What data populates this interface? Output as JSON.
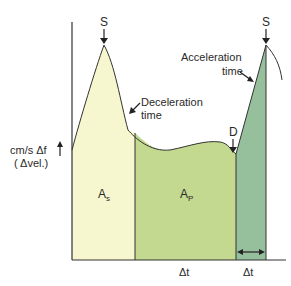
{
  "diagram": {
    "y_axis_label_line1": "cm/s  Δf",
    "y_axis_label_line2": "( Δvel.)",
    "peak_left_label": "S",
    "peak_right_label": "S",
    "dip_label": "D",
    "deceleration_label_line1": "Deceleration",
    "deceleration_label_line2": "time",
    "acceleration_label_line1": "Acceleration",
    "acceleration_label_line2": "time",
    "area_s_label": "A",
    "area_s_sub": "s",
    "area_p_label": "A",
    "area_p_sub": "P",
    "delta_t_left": "Δt",
    "delta_t_right": "Δt",
    "colors": {
      "area_s": "#f6f6cf",
      "area_p": "#c2d98f",
      "area_accel": "#96bf9c",
      "outline": "#333333"
    }
  }
}
